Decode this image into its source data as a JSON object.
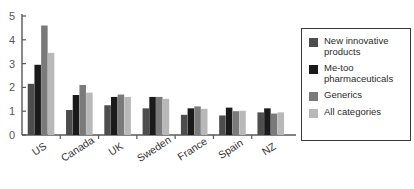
{
  "chart_data": {
    "type": "bar",
    "title": "",
    "subtitle": "",
    "xlabel": "",
    "ylabel": "",
    "ylim": [
      0,
      5
    ],
    "yticks": [
      0,
      1,
      2,
      3,
      4,
      5
    ],
    "ytick_labels": [
      "0",
      "1",
      "2",
      "3",
      "4",
      "5"
    ],
    "grid": false,
    "legend_position": "right",
    "categories": [
      "US",
      "Canada",
      "UK",
      "Sweden",
      "France",
      "Spain",
      "NZ"
    ],
    "series": [
      {
        "name": "New innovative products",
        "color": "#4d4d4d",
        "values": [
          2.15,
          1.05,
          1.25,
          1.12,
          0.85,
          0.82,
          0.95
        ]
      },
      {
        "name": "Me-too pharmaceuticals",
        "color": "#1a1a1a",
        "values": [
          2.95,
          1.68,
          1.6,
          1.6,
          1.12,
          1.15,
          1.12
        ]
      },
      {
        "name": "Generics",
        "color": "#7a7a7a",
        "values": [
          4.6,
          2.1,
          1.7,
          1.6,
          1.2,
          1.0,
          0.9
        ]
      },
      {
        "name": "All categories",
        "color": "#b8b8b8",
        "values": [
          3.45,
          1.78,
          1.6,
          1.52,
          1.1,
          1.02,
          0.95
        ]
      }
    ]
  },
  "legend": {
    "items": [
      {
        "label": "New innovative\nproducts",
        "color": "#4d4d4d"
      },
      {
        "label": "Me-too\npharmaceuticals",
        "color": "#1a1a1a"
      },
      {
        "label": "Generics",
        "color": "#7a7a7a"
      },
      {
        "label": "All categories",
        "color": "#b8b8b8"
      }
    ]
  },
  "axis": {
    "line_color": "#58585a"
  }
}
